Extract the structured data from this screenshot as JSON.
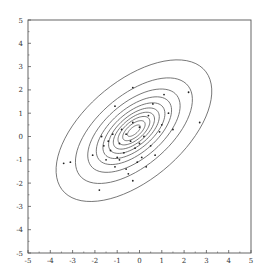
{
  "chart_data": {
    "type": "scatter",
    "title": "",
    "xlabel": "",
    "ylabel": "",
    "xlim": [
      -5,
      5
    ],
    "ylim": [
      -5,
      5
    ],
    "grid": false,
    "legend": null,
    "x_ticks": [
      "-5",
      "-4",
      "-3",
      "-2",
      "-1",
      "0",
      "1",
      "2",
      "3",
      "4",
      "5"
    ],
    "y_ticks": [
      "5",
      "4",
      "3",
      "2",
      "1",
      "0",
      "-1",
      "-2",
      "-3",
      "-4",
      "-5"
    ],
    "contours": {
      "description": "Concentric elliptical density contours of a correlated bivariate distribution",
      "center": [
        -0.25,
        0.25
      ],
      "rotation_deg": 38,
      "count": 10,
      "semi_axes": [
        [
          0.35,
          0.15
        ],
        [
          0.6,
          0.28
        ],
        [
          0.85,
          0.4
        ],
        [
          1.1,
          0.52
        ],
        [
          1.35,
          0.65
        ],
        [
          1.65,
          0.8
        ],
        [
          2.0,
          0.98
        ],
        [
          2.45,
          1.22
        ],
        [
          3.1,
          1.55
        ],
        [
          4.1,
          2.15
        ]
      ]
    },
    "points": [
      {
        "x": -3.4,
        "y": -1.15
      },
      {
        "x": -3.1,
        "y": -1.1
      },
      {
        "x": -2.1,
        "y": -0.8
      },
      {
        "x": -1.8,
        "y": -2.3
      },
      {
        "x": -1.6,
        "y": -0.4
      },
      {
        "x": -1.5,
        "y": -1.0
      },
      {
        "x": -1.4,
        "y": -0.2
      },
      {
        "x": -1.3,
        "y": -0.6
      },
      {
        "x": -1.2,
        "y": 0.1
      },
      {
        "x": -1.1,
        "y": -1.3
      },
      {
        "x": -1.0,
        "y": -0.9
      },
      {
        "x": -0.9,
        "y": -0.3
      },
      {
        "x": -0.8,
        "y": 0.3
      },
      {
        "x": -0.7,
        "y": -0.7
      },
      {
        "x": -0.6,
        "y": -1.4
      },
      {
        "x": -0.5,
        "y": -1.6
      },
      {
        "x": -0.4,
        "y": -0.2
      },
      {
        "x": -0.3,
        "y": 0.6
      },
      {
        "x": -0.2,
        "y": -0.5
      },
      {
        "x": -0.1,
        "y": -1.1
      },
      {
        "x": -0.3,
        "y": -1.9
      },
      {
        "x": 0.0,
        "y": 0.4
      },
      {
        "x": 0.1,
        "y": -0.9
      },
      {
        "x": 0.2,
        "y": 0.0
      },
      {
        "x": 0.3,
        "y": -1.3
      },
      {
        "x": 0.4,
        "y": 0.9
      },
      {
        "x": 0.5,
        "y": -0.4
      },
      {
        "x": 0.6,
        "y": 1.4
      },
      {
        "x": 0.7,
        "y": -0.8
      },
      {
        "x": 0.9,
        "y": 0.2
      },
      {
        "x": 1.0,
        "y": 0.5
      },
      {
        "x": 1.1,
        "y": 1.8
      },
      {
        "x": -1.1,
        "y": 1.3
      },
      {
        "x": -0.3,
        "y": 2.1
      },
      {
        "x": 1.5,
        "y": 0.3
      },
      {
        "x": 1.3,
        "y": 1.0
      },
      {
        "x": 2.2,
        "y": 1.9
      },
      {
        "x": 2.7,
        "y": 0.6
      },
      {
        "x": -1.7,
        "y": 0.0
      },
      {
        "x": -0.6,
        "y": 0.1
      },
      {
        "x": -0.9,
        "y": -1.0
      },
      {
        "x": 0.0,
        "y": -0.3
      }
    ],
    "colors": {
      "line": "#555555",
      "point": "#222222",
      "axis": "#555555"
    }
  }
}
